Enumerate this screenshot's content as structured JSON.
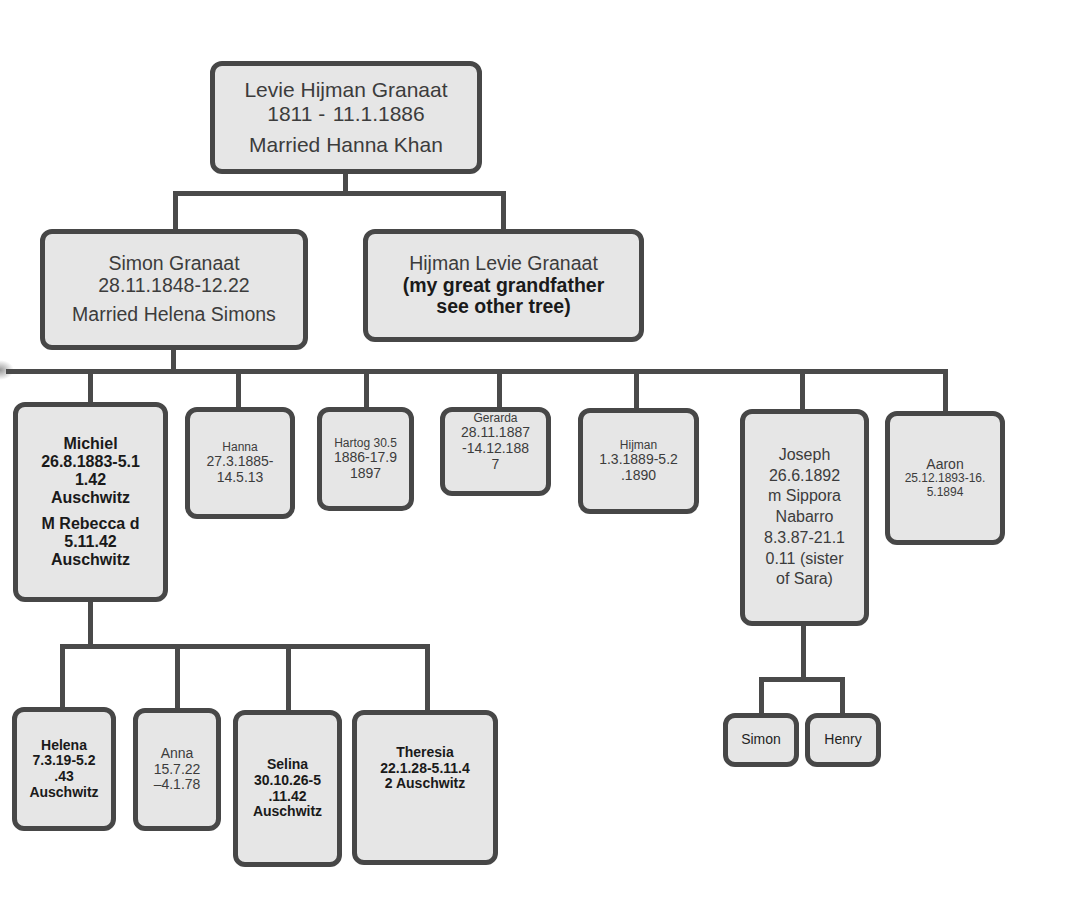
{
  "diagram": {
    "type": "family-tree",
    "root": {
      "name": "Levie Hijman Granaat",
      "dates": "1811 -  11.1.1886",
      "spouse": "Married Hanna Khan"
    },
    "generation2": [
      {
        "name": "Simon Granaat",
        "dates": "28.11.1848-12.22",
        "spouse": "Married Helena Simons"
      },
      {
        "name": "Hijman Levie Granaat",
        "note_line1": "(my great grandfather",
        "note_line2": "see other tree)"
      }
    ],
    "generation3": [
      {
        "lines": [
          "Michiel",
          "26.8.1883-5.1",
          "1.42",
          "Auschwitz"
        ],
        "spouse_lines": [
          "M Rebecca d",
          "5.11.42",
          "Auschwitz"
        ]
      },
      {
        "lines": [
          "Hanna",
          "27.3.1885-",
          "14.5.13"
        ]
      },
      {
        "lines": [
          "Hartog 30.5",
          "1886-17.9",
          "1897"
        ]
      },
      {
        "lines": [
          "Gerarda",
          "28.11.1887",
          "-14.12.188",
          "7"
        ]
      },
      {
        "lines": [
          "Hijman",
          "1.3.1889-5.2",
          ".1890"
        ]
      },
      {
        "lines": [
          "Joseph",
          "26.6.1892",
          "m Sippora",
          "Nabarro",
          "8.3.87-21.1",
          "0.11 (sister",
          "of Sara)"
        ]
      },
      {
        "lines": [
          "Aaron",
          "25.12.1893-16.",
          "5.1894"
        ]
      }
    ],
    "michiel_children": [
      {
        "lines": [
          "Helena",
          "7.3.19-5.2",
          ".43",
          "Auschwitz"
        ]
      },
      {
        "lines": [
          "Anna",
          "15.7.22",
          "–4.1.78"
        ]
      },
      {
        "lines": [
          "Selina",
          "30.10.26-5",
          ".11.42",
          "Auschwitz"
        ]
      },
      {
        "lines": [
          "Theresia",
          "22.1.28-5.11.4",
          "2 Auschwitz"
        ]
      }
    ],
    "joseph_children": [
      {
        "lines": [
          "Simon"
        ]
      },
      {
        "lines": [
          "Henry"
        ]
      }
    ],
    "colors": {
      "box_fill": "#e6e6e6",
      "box_border": "#474747",
      "connector": "#4a4a4a",
      "text": "#3c3c3c",
      "bold_text": "#1a1a1a"
    }
  }
}
